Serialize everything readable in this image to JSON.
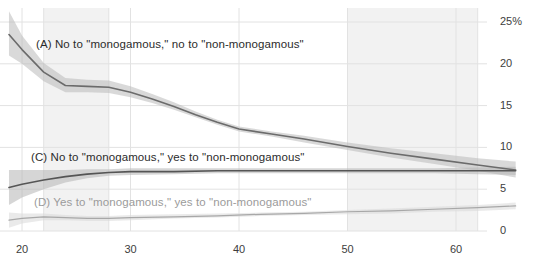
{
  "chart_data": {
    "type": "line",
    "title": "",
    "subtitle": "",
    "xlabel": "",
    "ylabel": "",
    "xlim": [
      18.0,
      66.0
    ],
    "ylim": [
      0,
      26.5
    ],
    "grid": true,
    "legend_position": "inline-annotations",
    "x_ticks": [
      "20",
      "30",
      "40",
      "50",
      "60"
    ],
    "x_tick_values": [
      20,
      30,
      40,
      50,
      60
    ],
    "y_ticks": [
      "25%",
      "20",
      "15",
      "10",
      "5",
      "0"
    ],
    "y_tick_values": [
      25,
      20,
      15,
      10,
      5,
      0
    ],
    "shaded_x_bands": [
      [
        22,
        28
      ],
      [
        50,
        62
      ]
    ],
    "series": [
      {
        "key": "A",
        "name": "(A) No to \"monogamous,\" no to \"non-monogamous\"",
        "color": "#6b6b6b",
        "band_color": "#b9b9b9",
        "x": [
          18.8,
          20.0,
          22.0,
          24.0,
          26.0,
          28.0,
          30.0,
          32.0,
          34.0,
          36.0,
          38.0,
          40.0,
          43.0,
          46.0,
          50.0,
          54.0,
          58.0,
          62.0,
          65.5
        ],
        "values": [
          23.5,
          21.7,
          19.0,
          17.4,
          17.3,
          17.2,
          16.6,
          15.8,
          14.9,
          13.9,
          13.0,
          12.2,
          11.6,
          11.0,
          10.1,
          9.3,
          8.6,
          7.9,
          7.3
        ],
        "lower": [
          21.0,
          20.0,
          17.9,
          16.6,
          16.6,
          16.5,
          16.0,
          15.3,
          14.5,
          13.6,
          12.7,
          11.9,
          11.3,
          10.6,
          9.7,
          8.8,
          8.0,
          7.2,
          6.4
        ],
        "upper": [
          26.3,
          23.4,
          20.1,
          18.3,
          18.1,
          18.0,
          17.3,
          16.4,
          15.4,
          14.3,
          13.3,
          12.5,
          11.9,
          11.4,
          10.6,
          9.9,
          9.3,
          8.7,
          8.3
        ]
      },
      {
        "key": "C",
        "name": "(C) No to \"monogamous,\" yes to \"non-monogamous\"",
        "color": "#555555",
        "band_color": "#b4b4b4",
        "x": [
          18.8,
          20.0,
          22.0,
          24.0,
          26.0,
          28.0,
          30.0,
          34.0,
          38.0,
          42.0,
          46.0,
          50.0,
          54.0,
          58.0,
          62.0,
          65.5
        ],
        "values": [
          5.2,
          5.6,
          6.1,
          6.5,
          6.8,
          7.0,
          7.1,
          7.1,
          7.2,
          7.2,
          7.2,
          7.2,
          7.2,
          7.2,
          7.2,
          7.2
        ],
        "lower": [
          3.1,
          4.0,
          5.0,
          5.8,
          6.3,
          6.6,
          6.7,
          6.8,
          6.9,
          6.9,
          6.9,
          6.9,
          6.9,
          6.9,
          6.8,
          6.7
        ],
        "upper": [
          7.3,
          7.3,
          7.3,
          7.3,
          7.4,
          7.4,
          7.5,
          7.5,
          7.5,
          7.5,
          7.5,
          7.5,
          7.5,
          7.5,
          7.6,
          7.7
        ]
      },
      {
        "key": "D",
        "name": "(D) Yes to \"monogamous,\" yes to \"non-monogamous\"",
        "color": "#a8a8a8",
        "band_color": "#d8d8d8",
        "x": [
          18.8,
          20.0,
          22.0,
          24.0,
          26.0,
          28.0,
          30.0,
          34.0,
          38.0,
          42.0,
          46.0,
          50.0,
          54.0,
          58.0,
          62.0,
          65.5
        ],
        "values": [
          1.3,
          1.5,
          1.7,
          1.6,
          1.5,
          1.5,
          1.6,
          1.7,
          1.8,
          2.0,
          2.1,
          2.3,
          2.4,
          2.6,
          2.8,
          3.0
        ],
        "lower": [
          0.4,
          0.9,
          1.3,
          1.3,
          1.2,
          1.2,
          1.3,
          1.5,
          1.6,
          1.8,
          1.9,
          2.0,
          2.1,
          2.3,
          2.4,
          2.6
        ],
        "upper": [
          2.2,
          2.1,
          2.1,
          1.9,
          1.8,
          1.8,
          1.9,
          2.0,
          2.1,
          2.2,
          2.3,
          2.5,
          2.7,
          2.9,
          3.1,
          3.4
        ]
      }
    ],
    "annotations": [
      {
        "key": "A",
        "text": "(A) No to \"monogamous,\" no to \"non-monogamous\"",
        "x_px": 36,
        "y_px": 38,
        "style": "dark"
      },
      {
        "key": "C",
        "text": "(C) No to \"monogamous,\" yes to \"non-monogamous\"",
        "x_px": 31,
        "y_px": 151,
        "style": "dark"
      },
      {
        "key": "D",
        "text": "(D) Yes to \"monogamous,\" yes to \"non-monogamous\"",
        "x_px": 34,
        "y_px": 196,
        "style": "light"
      }
    ]
  },
  "axes": {
    "y_tick_labels": [
      "25%",
      "20",
      "15",
      "10",
      "5",
      "0"
    ],
    "x_tick_labels": [
      "20",
      "30",
      "40",
      "50",
      "60"
    ]
  },
  "colors": {
    "background": "#ffffff",
    "gridline": "#e2e2e2",
    "band_shade": "#f2f2f2",
    "tick_text": "#3d3d3d",
    "label_dark": "#2b2b2b",
    "label_light": "#9b9b9b"
  }
}
